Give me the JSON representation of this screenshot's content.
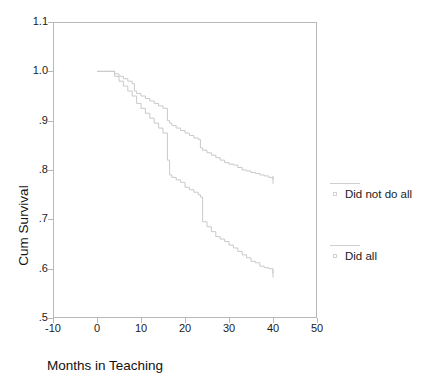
{
  "chart_data": {
    "type": "line",
    "subtype": "kaplan-meier-survival",
    "title": "",
    "xlabel": "Months in Teaching",
    "ylabel": "Cum Survival",
    "xlim": [
      -10,
      50
    ],
    "ylim": [
      0.5,
      1.1
    ],
    "xticks": [
      -10,
      0,
      10,
      20,
      30,
      40,
      50
    ],
    "xtick_labels": [
      "-10",
      "0",
      "10",
      "20",
      "30",
      "40",
      "50"
    ],
    "yticks": [
      0.5,
      0.6,
      0.7,
      0.8,
      0.9,
      1.0,
      1.1
    ],
    "ytick_labels": [
      ".5",
      ".6",
      ".7",
      ".8",
      ".9",
      "1.0",
      "1.1"
    ],
    "grid": false,
    "legend_position": "right",
    "line_color": "#c9c9c9",
    "frame_color": "#b8b8b8",
    "series": [
      {
        "name": "Did not do all",
        "x": [
          0,
          3,
          4,
          5,
          6,
          7,
          8,
          8.5,
          9,
          10,
          11,
          12,
          13,
          14,
          15,
          16,
          16.5,
          17,
          18,
          19,
          20,
          21,
          22,
          23,
          23.5,
          24,
          25,
          26,
          27,
          28,
          29,
          30,
          31,
          32,
          33,
          34,
          35,
          36,
          37,
          38,
          39,
          40
        ],
        "y": [
          1.0,
          1.0,
          0.995,
          0.99,
          0.985,
          0.98,
          0.975,
          0.96,
          0.955,
          0.95,
          0.945,
          0.94,
          0.935,
          0.93,
          0.925,
          0.9,
          0.895,
          0.89,
          0.885,
          0.88,
          0.875,
          0.87,
          0.865,
          0.862,
          0.845,
          0.84,
          0.835,
          0.83,
          0.825,
          0.82,
          0.815,
          0.812,
          0.81,
          0.805,
          0.8,
          0.798,
          0.795,
          0.793,
          0.79,
          0.788,
          0.785,
          0.78
        ]
      },
      {
        "name": "Did all",
        "x": [
          0,
          3,
          4,
          5,
          6,
          7,
          8,
          9,
          10,
          11,
          12,
          13,
          14,
          15,
          16,
          16.5,
          17,
          18,
          19,
          20,
          21,
          22,
          23,
          23.5,
          24,
          25,
          26,
          27,
          28,
          29,
          30,
          31,
          32,
          33,
          34,
          35,
          36,
          37,
          38,
          39,
          40
        ],
        "y": [
          1.0,
          1.0,
          0.99,
          0.98,
          0.97,
          0.96,
          0.95,
          0.935,
          0.925,
          0.915,
          0.905,
          0.895,
          0.885,
          0.875,
          0.82,
          0.79,
          0.785,
          0.78,
          0.775,
          0.765,
          0.76,
          0.755,
          0.75,
          0.745,
          0.695,
          0.685,
          0.675,
          0.665,
          0.66,
          0.655,
          0.648,
          0.642,
          0.635,
          0.628,
          0.622,
          0.615,
          0.612,
          0.605,
          0.602,
          0.6,
          0.59
        ]
      }
    ]
  },
  "legend": {
    "entries": [
      {
        "label": "Did not do all",
        "marker": "square-outline",
        "line": "solid"
      },
      {
        "label": "Did all",
        "marker": "square-outline",
        "line": "solid"
      }
    ]
  },
  "axes": {
    "x_title": "Months in Teaching",
    "y_title": "Cum Survival"
  }
}
